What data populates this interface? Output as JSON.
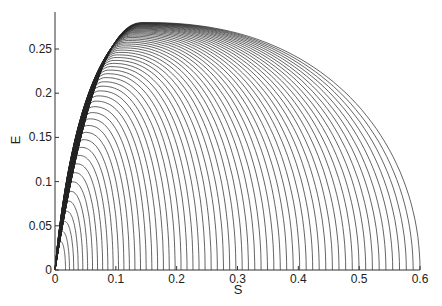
{
  "chart_data": {
    "type": "line",
    "title": "",
    "xlabel": "S",
    "ylabel": "E",
    "xlim": [
      0,
      0.6
    ],
    "ylim": [
      0,
      0.28
    ],
    "xticks": [
      "0",
      "0.1",
      "0.2",
      "0.3",
      "0.4",
      "0.5",
      "0.6"
    ],
    "yticks": [
      "0",
      "0.05",
      "0.1",
      "0.15",
      "0.2",
      "0.25"
    ],
    "grid": false,
    "legend": null,
    "series_params": {
      "count": 60,
      "s_end_min": 0.012,
      "s_end_max": 0.6,
      "peak_max_E": 0.28,
      "peak_max_S": 0.14,
      "initial_slope": 3.3
    }
  },
  "axes": {
    "x_label": "S",
    "y_label": "E"
  }
}
